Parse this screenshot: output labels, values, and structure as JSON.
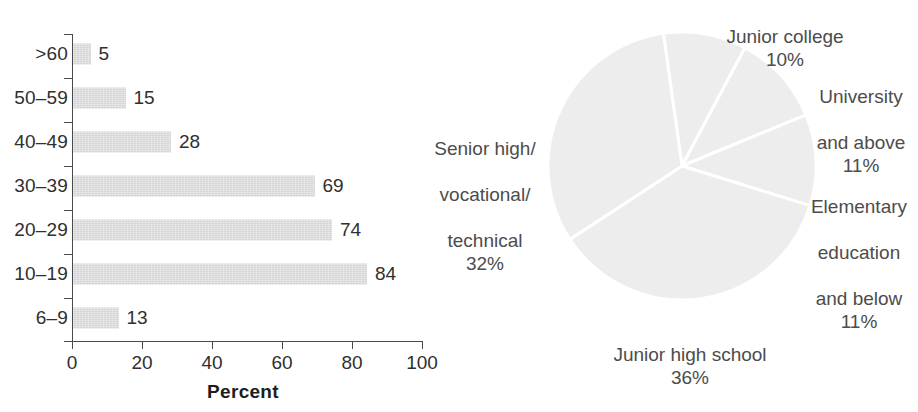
{
  "chart_data": [
    {
      "type": "bar",
      "orientation": "horizontal",
      "title": "",
      "xlabel": "Percent",
      "ylabel": "",
      "xlim": [
        0,
        100
      ],
      "xticks": [
        0,
        20,
        40,
        60,
        80,
        100
      ],
      "grid": false,
      "legend": "none",
      "bar_color": "#d5d5d5",
      "categories": [
        ">60",
        "50–59",
        "40–49",
        "30–39",
        "20–29",
        "10–19",
        "6–9"
      ],
      "values": [
        5,
        15,
        28,
        69,
        74,
        84,
        13
      ],
      "value_labels": [
        "5",
        "15",
        "28",
        "69",
        "74",
        "84",
        "13"
      ]
    },
    {
      "type": "pie",
      "title": "",
      "legend": "labels-outside",
      "slice_color": "#ededed",
      "separator_color": "#ffffff",
      "start_angle_deg": -8,
      "labels": [
        "Junior college",
        "University and above",
        "Elementary education and below",
        "Junior high school",
        "Senior high/ vocational/ technical"
      ],
      "values": [
        10,
        11,
        11,
        36,
        32
      ],
      "value_labels": [
        "10%",
        "11%",
        "11%",
        "36%",
        "32%"
      ],
      "slices": [
        {
          "name": "junior-college",
          "label_lines": [
            "Junior college"
          ],
          "percent_label": "10%",
          "value": 10
        },
        {
          "name": "university",
          "label_lines": [
            "University",
            "and above"
          ],
          "percent_label": "11%",
          "value": 11
        },
        {
          "name": "elementary",
          "label_lines": [
            "Elementary",
            "education",
            "and below"
          ],
          "percent_label": "11%",
          "value": 11
        },
        {
          "name": "junior-high",
          "label_lines": [
            "Junior high school"
          ],
          "percent_label": "36%",
          "value": 36
        },
        {
          "name": "senior-high",
          "label_lines": [
            "Senior high/",
            "vocational/",
            "technical"
          ],
          "percent_label": "32%",
          "value": 32
        }
      ]
    }
  ],
  "bar_chart": {
    "axis_title": "Percent",
    "x_ticks": [
      "0",
      "20",
      "40",
      "60",
      "80",
      "100"
    ],
    "rows": [
      {
        "category": ">60",
        "value": 5,
        "value_label": "5"
      },
      {
        "category": "50–59",
        "value": 15,
        "value_label": "15"
      },
      {
        "category": "40–49",
        "value": 28,
        "value_label": "28"
      },
      {
        "category": "30–39",
        "value": 69,
        "value_label": "69"
      },
      {
        "category": "20–29",
        "value": 74,
        "value_label": "74"
      },
      {
        "category": "10–19",
        "value": 84,
        "value_label": "84"
      },
      {
        "category": "6–9",
        "value": 13,
        "value_label": "13"
      }
    ]
  },
  "pie_chart": {
    "junior_college": {
      "line1": "Junior college",
      "percent": "10%"
    },
    "university": {
      "line1": "University",
      "line2": "and above",
      "percent": "11%"
    },
    "elementary": {
      "line1": "Elementary",
      "line2": "education",
      "line3": "and below",
      "percent": "11%"
    },
    "junior_high": {
      "line1": "Junior high school",
      "percent": "36%"
    },
    "senior_high": {
      "line1": "Senior high/",
      "line2": "vocational/",
      "line3": "technical",
      "percent": "32%"
    }
  },
  "colors": {
    "bar_fill": "#d5d5d5",
    "pie_fill": "#ededed",
    "axis": "#4a4a4a",
    "text": "#2f2f2f",
    "pie_label_text": "#4c4c4c",
    "background": "#ffffff"
  }
}
